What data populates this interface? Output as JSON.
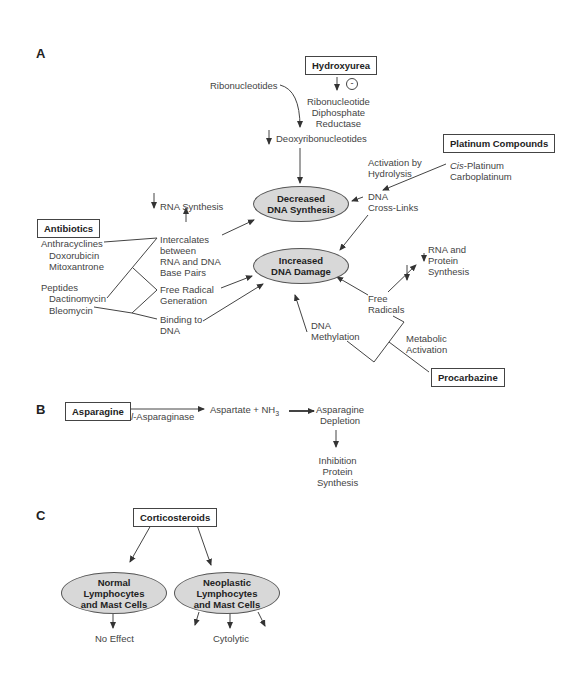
{
  "panels": {
    "a": "A",
    "b": "B",
    "c": "C"
  },
  "panel_a": {
    "drugs": {
      "hydroxyurea": "Hydroxyurea",
      "platinum": "Platinum Compounds",
      "antibiotics": "Antibiotics",
      "procarbazine": "Procarbazine"
    },
    "inhibit_symbol": "-",
    "ribonucleotides": "Ribonucleotides",
    "rdr": [
      "Ribonucleotide",
      "Diphosphate",
      "Reductase"
    ],
    "deoxy": "Deoxyribonucleotides",
    "activation": [
      "Activation by",
      "Hydrolysis"
    ],
    "platinum_members": {
      "cis_prefix": "Cis",
      "cis_rest": "-Platinum",
      "carbo": "Carboplatinum"
    },
    "dna_crosslinks": [
      "DNA",
      "Cross-Links"
    ],
    "decreased": [
      "Decreased",
      "DNA Synthesis"
    ],
    "increased": [
      "Increased",
      "DNA Damage"
    ],
    "rna_synthesis": "RNA Synthesis",
    "antibiotic_members": {
      "anthracyclines": "Anthracyclines",
      "doxorubicin": "Doxorubicin",
      "mitoxantrone": "Mitoxantrone",
      "peptides": "Peptides",
      "dactinomycin": "Dactinomycin",
      "bleomycin": "Bleomycin"
    },
    "intercalates": [
      "Intercalates",
      "between",
      "RNA and DNA",
      "Base Pairs"
    ],
    "free_radical_gen": [
      "Free Radical",
      "Generation"
    ],
    "binding": [
      "Binding to",
      "DNA"
    ],
    "rna_protein": [
      "RNA and",
      "Protein",
      "Synthesis"
    ],
    "free_radicals": [
      "Free",
      "Radicals"
    ],
    "dna_methylation": [
      "DNA",
      "Methylation"
    ],
    "metabolic": [
      "Metabolic",
      "Activation"
    ]
  },
  "panel_b": {
    "asparagine": "Asparagine",
    "enzyme": "l-Asparaginase",
    "enzyme_italic": "l",
    "enzyme_rest": "-Asparaginase",
    "products": "Aspartate + NH",
    "products_sub": "3",
    "depletion": [
      "Asparagine",
      "Depletion"
    ],
    "inhibition": [
      "Inhibition",
      "Protein",
      "Synthesis"
    ]
  },
  "panel_c": {
    "corticosteroids": "Corticosteroids",
    "normal": [
      "Normal",
      "Lymphocytes",
      "and Mast Cells"
    ],
    "neoplastic": [
      "Neoplastic",
      "Lymphocytes",
      "and Mast Cells"
    ],
    "no_effect": "No Effect",
    "cytolytic": "Cytolytic"
  }
}
